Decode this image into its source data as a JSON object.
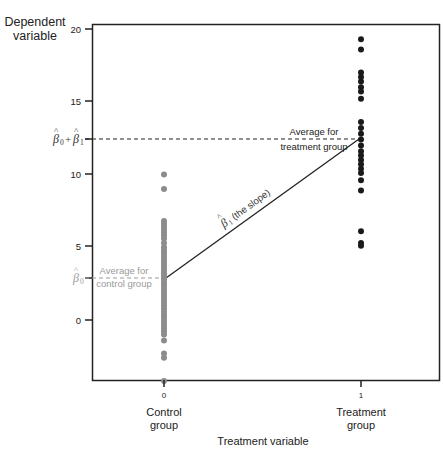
{
  "chart_data": {
    "type": "scatter",
    "title": "",
    "ylabel": "Dependent variable",
    "xlabel": "Treatment variable",
    "ylim": [
      -5.5,
      20.5
    ],
    "xlim": [
      -0.37,
      1.39
    ],
    "yticks": [
      0,
      5,
      10,
      15,
      20
    ],
    "xticks": [
      0,
      1
    ],
    "xtick_labels": [
      "0",
      "1"
    ],
    "x_category_labels": [
      "Control group",
      "Treatment group"
    ],
    "grid": false,
    "legend": null,
    "series": [
      {
        "name": "Control group",
        "x": 0,
        "color": "#8c8c8c",
        "values": [
          10.0,
          9.0,
          6.8,
          6.6,
          6.4,
          6.2,
          6.0,
          5.8,
          5.6,
          5.3,
          5.0,
          4.8,
          4.6,
          4.4,
          4.2,
          4.0,
          3.8,
          3.6,
          3.4,
          3.2,
          3.0,
          2.8,
          2.6,
          2.4,
          2.2,
          2.0,
          1.8,
          1.6,
          1.4,
          1.2,
          1.0,
          0.8,
          0.6,
          0.4,
          0.2,
          0.0,
          -0.2,
          -0.4,
          -0.6,
          -0.8,
          -1.0,
          -1.4,
          -2.3,
          -2.6,
          -4.2
        ]
      },
      {
        "name": "Treatment group",
        "x": 1,
        "color": "#1a1a1a",
        "values": [
          19.3,
          18.6,
          17.0,
          16.7,
          16.4,
          16.0,
          15.7,
          15.2,
          13.6,
          13.2,
          12.8,
          12.4,
          12.0,
          11.6,
          11.3,
          11.0,
          10.7,
          10.4,
          10.1,
          9.6,
          8.9,
          6.1,
          5.3,
          5.1
        ]
      }
    ],
    "annotations": {
      "control_mean": {
        "value": 2.9,
        "label": "Average for control group",
        "axis_label": "β̂0"
      },
      "treatment_mean": {
        "value": 11.6,
        "label": "Average for treatment group",
        "axis_label": "β̂0 + β̂1"
      },
      "slope_label": "β̂1 (the slope)"
    }
  },
  "axis": {
    "y_title_line1": "Dependent",
    "y_title_line2": "variable",
    "x_title": "Treatment variable",
    "ytick_20": "20",
    "ytick_15": "15",
    "ytick_10": "10",
    "ytick_5": "5",
    "ytick_0": "0",
    "xtick_0": "0",
    "xtick_1": "1",
    "x0_line1": "Control",
    "x0_line2": "group",
    "x1_line1": "Treatment",
    "x1_line2": "group",
    "b0b1_label": "β̂0 + β̂1",
    "b0_label": "β̂0"
  },
  "annotations": {
    "treat_line1": "Average for",
    "treat_line2": "treatment group",
    "ctrl_line1": "Average for",
    "ctrl_line2": "control group",
    "slope": "(the slope)"
  },
  "colors": {
    "control": "#8c8c8c",
    "treatment": "#1a1a1a",
    "axis": "#222222",
    "control_text": "#9a9a9a"
  }
}
